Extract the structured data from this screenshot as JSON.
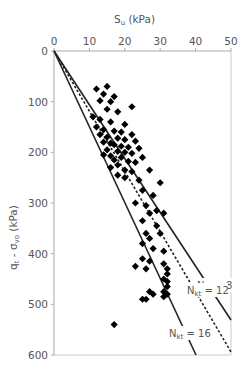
{
  "chart_data": {
    "type": "scatter",
    "title": "",
    "xlabel": "S_u (kPa)",
    "xlabel_main": "S",
    "xlabel_sub": "u",
    "xlabel_unit": " (kPa)",
    "ylabel": "q_t - σ_vo (kPa)",
    "ylabel_main": "q",
    "ylabel_sub1": "t",
    "ylabel_mid": " - σ",
    "ylabel_sub2": "vo",
    "ylabel_unit": " (kPa)",
    "x_axis_position": "top",
    "y_axis_inverted": true,
    "xlim": [
      0,
      50
    ],
    "ylim": [
      0,
      600
    ],
    "x_ticks": [
      0,
      10,
      20,
      30,
      40,
      50
    ],
    "y_ticks": [
      0,
      100,
      200,
      300,
      400,
      500,
      600
    ],
    "grid": false,
    "legend": null,
    "series": [
      {
        "name": "Measured data",
        "marker": "diamond",
        "color": "#000000",
        "points": [
          [
            12,
            75
          ],
          [
            15,
            70
          ],
          [
            14,
            85
          ],
          [
            17,
            90
          ],
          [
            13,
            98
          ],
          [
            16,
            100
          ],
          [
            22,
            110
          ],
          [
            15,
            115
          ],
          [
            18,
            120
          ],
          [
            11,
            130
          ],
          [
            13,
            135
          ],
          [
            16,
            140
          ],
          [
            20,
            145
          ],
          [
            12,
            150
          ],
          [
            14,
            155
          ],
          [
            17,
            158
          ],
          [
            19,
            160
          ],
          [
            22,
            165
          ],
          [
            13,
            165
          ],
          [
            15,
            170
          ],
          [
            18,
            172
          ],
          [
            20,
            175
          ],
          [
            23,
            178
          ],
          [
            14,
            180
          ],
          [
            16,
            182
          ],
          [
            17,
            185
          ],
          [
            19,
            188
          ],
          [
            21,
            190
          ],
          [
            24,
            192
          ],
          [
            15,
            195
          ],
          [
            18,
            198
          ],
          [
            20,
            200
          ],
          [
            22,
            202
          ],
          [
            14,
            205
          ],
          [
            16,
            207
          ],
          [
            19,
            210
          ],
          [
            25,
            210
          ],
          [
            17,
            215
          ],
          [
            21,
            218
          ],
          [
            23,
            220
          ],
          [
            18,
            225
          ],
          [
            16,
            230
          ],
          [
            20,
            235
          ],
          [
            22,
            238
          ],
          [
            27,
            235
          ],
          [
            18,
            245
          ],
          [
            20,
            250
          ],
          [
            24,
            255
          ],
          [
            30,
            260
          ],
          [
            25,
            275
          ],
          [
            28,
            285
          ],
          [
            23,
            300
          ],
          [
            26,
            305
          ],
          [
            29,
            315
          ],
          [
            31,
            320
          ],
          [
            27,
            320
          ],
          [
            25,
            335
          ],
          [
            29,
            345
          ],
          [
            26,
            360
          ],
          [
            30,
            360
          ],
          [
            27,
            370
          ],
          [
            25,
            380
          ],
          [
            28,
            390
          ],
          [
            31,
            395
          ],
          [
            25,
            410
          ],
          [
            27,
            415
          ],
          [
            31,
            420
          ],
          [
            23,
            425
          ],
          [
            26,
            430
          ],
          [
            32,
            430
          ],
          [
            32,
            440
          ],
          [
            31,
            450
          ],
          [
            32,
            455
          ],
          [
            32,
            465
          ],
          [
            31,
            475
          ],
          [
            27,
            475
          ],
          [
            28,
            480
          ],
          [
            25,
            490
          ],
          [
            26,
            490
          ],
          [
            31,
            485
          ],
          [
            32,
            480
          ],
          [
            17,
            540
          ]
        ]
      }
    ],
    "reference_lines": [
      {
        "label_main": "N",
        "label_sub": "kt",
        "label_value": " = 8",
        "N_kt": 8,
        "style": "solid"
      },
      {
        "label_main": "N",
        "label_sub": "kt",
        "label_value": " = 12",
        "N_kt": 12,
        "style": "dashed"
      },
      {
        "label_main": "N",
        "label_sub": "kt",
        "label_value": " = 16",
        "N_kt": 16,
        "style": "solid"
      }
    ],
    "relationship": "S_u = (q_t - σ_vo) / N_kt"
  }
}
